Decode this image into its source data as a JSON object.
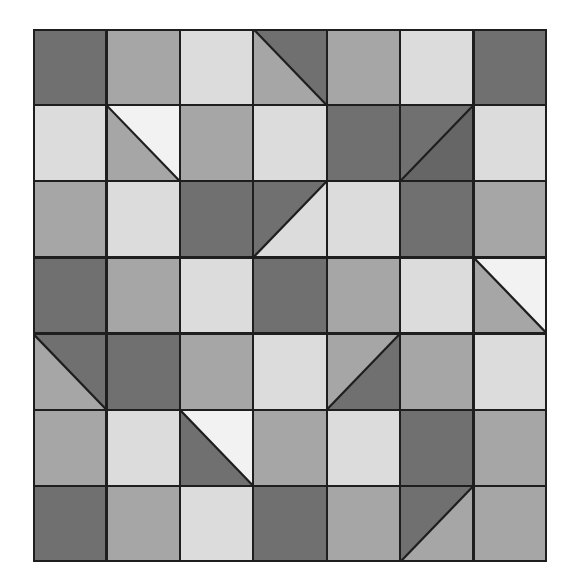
{
  "figure": {
    "kind": "geometric-tile-grid",
    "rows": 7,
    "columns": 7,
    "background_color": "#ffffff",
    "line_color": "#1e1e1e"
  },
  "palette": {
    "dark": "#707070",
    "darker": "#666666",
    "medium": "#a6a6a6",
    "medium_light": "#b5b5b5",
    "light": "#dcdcdc",
    "white": "#f2f2f2"
  },
  "geometry": {
    "origin_x": 33,
    "origin_y": 29,
    "grid_width": 514,
    "grid_height": 533,
    "cell_width": 73.43,
    "cell_height": 76.14
  },
  "tiles": [
    [
      {
        "type": "solid",
        "fill": "dark"
      },
      {
        "type": "solid",
        "fill": "medium"
      },
      {
        "type": "solid",
        "fill": "light"
      },
      {
        "type": "split",
        "diagonal": "tl-br",
        "fill_a": "medium",
        "fill_b": "dark"
      },
      {
        "type": "solid",
        "fill": "medium"
      },
      {
        "type": "solid",
        "fill": "light"
      },
      {
        "type": "solid",
        "fill": "dark"
      }
    ],
    [
      {
        "type": "solid",
        "fill": "light"
      },
      {
        "type": "split",
        "diagonal": "tl-br",
        "fill_a": "medium",
        "fill_b": "white"
      },
      {
        "type": "solid",
        "fill": "medium"
      },
      {
        "type": "solid",
        "fill": "light"
      },
      {
        "type": "solid",
        "fill": "dark"
      },
      {
        "type": "split",
        "diagonal": "bl-tr",
        "fill_a": "dark",
        "fill_b": "darker"
      },
      {
        "type": "solid",
        "fill": "light"
      }
    ],
    [
      {
        "type": "solid",
        "fill": "medium"
      },
      {
        "type": "solid",
        "fill": "light"
      },
      {
        "type": "solid",
        "fill": "dark"
      },
      {
        "type": "split",
        "diagonal": "bl-tr",
        "fill_a": "dark",
        "fill_b": "light"
      },
      {
        "type": "solid",
        "fill": "light"
      },
      {
        "type": "solid",
        "fill": "dark"
      },
      {
        "type": "solid",
        "fill": "medium"
      }
    ],
    [
      {
        "type": "solid",
        "fill": "dark"
      },
      {
        "type": "solid",
        "fill": "medium"
      },
      {
        "type": "solid",
        "fill": "light"
      },
      {
        "type": "solid",
        "fill": "dark"
      },
      {
        "type": "solid",
        "fill": "medium"
      },
      {
        "type": "solid",
        "fill": "light"
      },
      {
        "type": "split",
        "diagonal": "tl-br",
        "fill_a": "medium",
        "fill_b": "white"
      }
    ],
    [
      {
        "type": "split",
        "diagonal": "tl-br",
        "fill_a": "medium",
        "fill_b": "dark"
      },
      {
        "type": "solid",
        "fill": "dark"
      },
      {
        "type": "solid",
        "fill": "medium"
      },
      {
        "type": "solid",
        "fill": "light"
      },
      {
        "type": "split",
        "diagonal": "bl-tr",
        "fill_a": "medium",
        "fill_b": "dark"
      },
      {
        "type": "solid",
        "fill": "medium"
      },
      {
        "type": "solid",
        "fill": "light"
      }
    ],
    [
      {
        "type": "solid",
        "fill": "medium"
      },
      {
        "type": "solid",
        "fill": "light"
      },
      {
        "type": "split",
        "diagonal": "tl-br",
        "fill_a": "dark",
        "fill_b": "white"
      },
      {
        "type": "solid",
        "fill": "medium"
      },
      {
        "type": "solid",
        "fill": "light"
      },
      {
        "type": "solid",
        "fill": "dark"
      },
      {
        "type": "solid",
        "fill": "medium"
      }
    ],
    [
      {
        "type": "solid",
        "fill": "dark"
      },
      {
        "type": "solid",
        "fill": "medium"
      },
      {
        "type": "solid",
        "fill": "light"
      },
      {
        "type": "solid",
        "fill": "dark"
      },
      {
        "type": "solid",
        "fill": "medium"
      },
      {
        "type": "split",
        "diagonal": "bl-tr",
        "fill_a": "dark",
        "fill_b": "medium"
      },
      {
        "type": "solid",
        "fill": "medium"
      }
    ]
  ]
}
